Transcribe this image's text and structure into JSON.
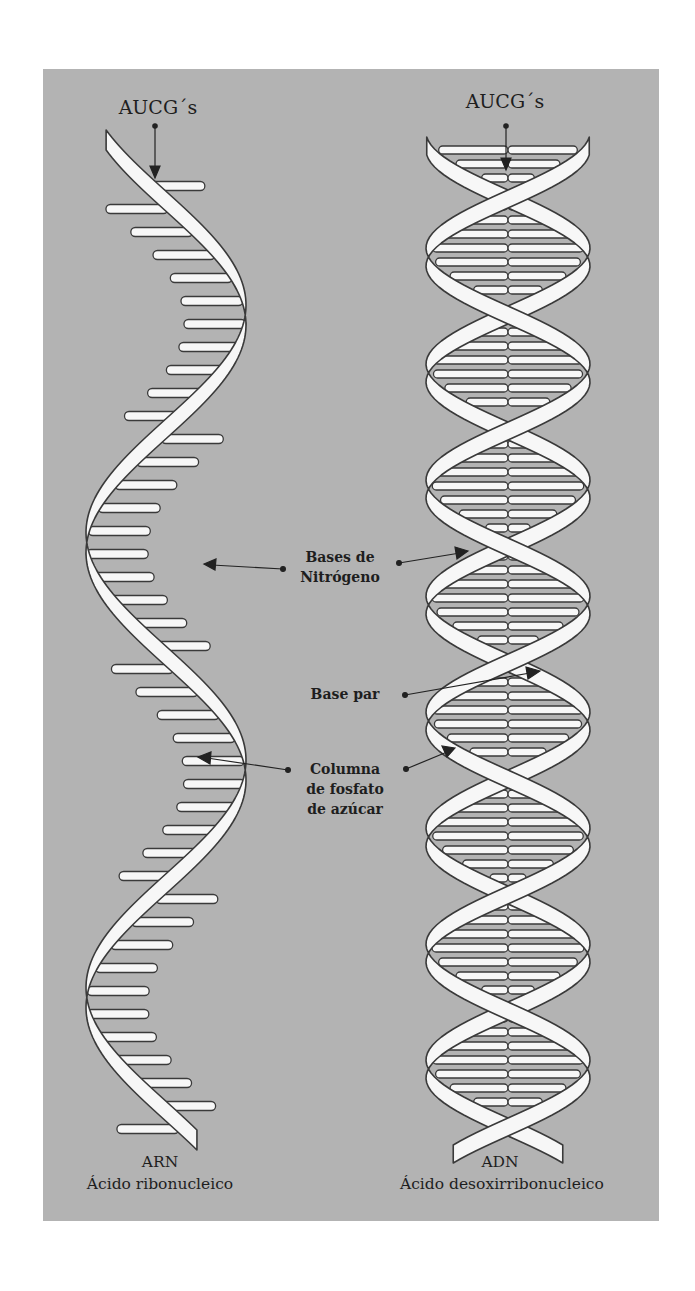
{
  "colors": {
    "background": "#ffffff",
    "panel": "#b3b3b3",
    "ribbon_fill": "#f7f7f7",
    "ribbon_stroke": "#3a3a3a",
    "text": "#1e1e1e"
  },
  "rna": {
    "top_label": "AUCG´s",
    "name": "ARN",
    "full_name": "Ácido ribonucleico"
  },
  "dna": {
    "top_label": "AUCG´s",
    "name": "ADN",
    "full_name": "Ácido desoxirribonucleico"
  },
  "annotations": {
    "nitrogen_bases": [
      "Bases de",
      "Nitrógeno"
    ],
    "base_pair": "Base par",
    "backbone": [
      "Columna",
      "de fosfato",
      "de azúcar"
    ]
  }
}
